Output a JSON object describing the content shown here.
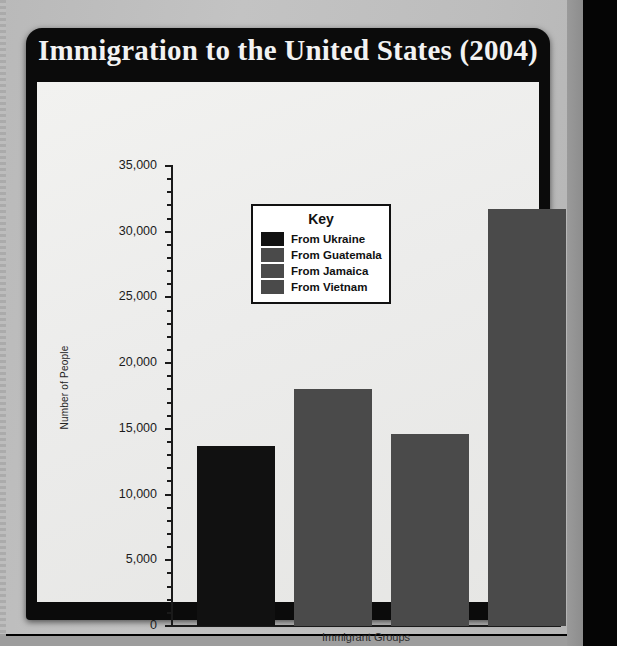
{
  "card": {
    "title": "Immigration to the United States (2004)"
  },
  "chart_data": {
    "type": "bar",
    "title": "Immigration to the United States (2004)",
    "xlabel": "Immigrant Groups",
    "ylabel": "Number of People",
    "ylim": [
      0,
      35000
    ],
    "grid": false,
    "ytick_labels": [
      "35,000",
      "30,000",
      "25,000",
      "20,000",
      "15,000",
      "10,000",
      "5,000",
      "0"
    ],
    "ytick_values": [
      35000,
      30000,
      25000,
      20000,
      15000,
      10000,
      5000,
      0
    ],
    "minor_tick_interval": 1000,
    "legend": {
      "title": "Key",
      "position": "inside-upper-center"
    },
    "categories": [
      "From Ukraine",
      "From Guatemala",
      "From Jamaica",
      "From Vietnam"
    ],
    "values": [
      13700,
      18000,
      14600,
      31700
    ],
    "colors": [
      "#111111",
      "#4a4a4a",
      "#4a4a4a",
      "#4a4a4a"
    ],
    "series": [
      {
        "name": "Immigrant Groups",
        "points": [
          {
            "label": "From Ukraine",
            "value": 13700,
            "color": "#111111"
          },
          {
            "label": "From Guatemala",
            "value": 18000,
            "color": "#4a4a4a"
          },
          {
            "label": "From Jamaica",
            "value": 14600,
            "color": "#4a4a4a"
          },
          {
            "label": "From Vietnam",
            "value": 31700,
            "color": "#4a4a4a"
          }
        ]
      }
    ]
  }
}
